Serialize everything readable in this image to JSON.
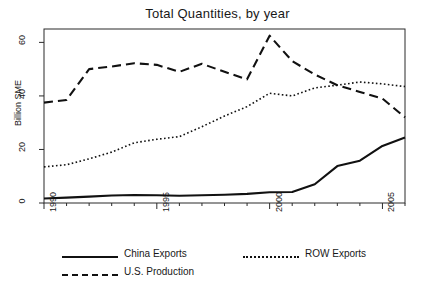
{
  "chart_data": {
    "type": "line",
    "title": "Total Quantities, by year",
    "xlabel": "",
    "ylabel": "Billion SME",
    "x": [
      1990,
      1991,
      1992,
      1993,
      1994,
      1995,
      1996,
      1997,
      1998,
      1999,
      2000,
      2001,
      2002,
      2003,
      2004,
      2005,
      2006
    ],
    "xtick_labels": [
      "1990",
      "1995",
      "2000",
      "2005"
    ],
    "xticks": [
      1990,
      1995,
      2000,
      2005
    ],
    "xlim": [
      1990,
      2006
    ],
    "ytick_labels": [
      "0",
      "20",
      "40",
      "60"
    ],
    "yticks": [
      0,
      20,
      40,
      60
    ],
    "ylim": [
      0,
      65
    ],
    "grid": false,
    "legend_position": "bottom",
    "series": [
      {
        "name": "China Exports",
        "style": "solid",
        "color": "#111111",
        "values": [
          1.7,
          2.0,
          2.4,
          2.8,
          3.0,
          2.9,
          2.7,
          2.9,
          3.1,
          3.4,
          4.0,
          4.1,
          7.0,
          13.8,
          15.8,
          21.3,
          24.5
        ]
      },
      {
        "name": "U.S. Production",
        "style": "dashed",
        "color": "#111111",
        "values": [
          37.5,
          38.5,
          50.0,
          51.0,
          52.2,
          51.6,
          49.0,
          52.0,
          49.0,
          46.2,
          62.5,
          53.0,
          48.0,
          44.0,
          41.5,
          39.0,
          32.0
        ]
      },
      {
        "name": "ROW Exports",
        "style": "dotted",
        "color": "#111111",
        "values": [
          13.5,
          14.3,
          16.5,
          19.0,
          22.5,
          23.8,
          24.8,
          28.5,
          32.5,
          36.0,
          41.0,
          40.0,
          43.0,
          44.0,
          45.2,
          44.5,
          43.5
        ]
      }
    ]
  },
  "legend": {
    "entries": [
      {
        "label": "China Exports",
        "style": "solid"
      },
      {
        "label": "U.S. Production",
        "style": "dashed"
      },
      {
        "label": "ROW Exports",
        "style": "dotted"
      }
    ]
  }
}
